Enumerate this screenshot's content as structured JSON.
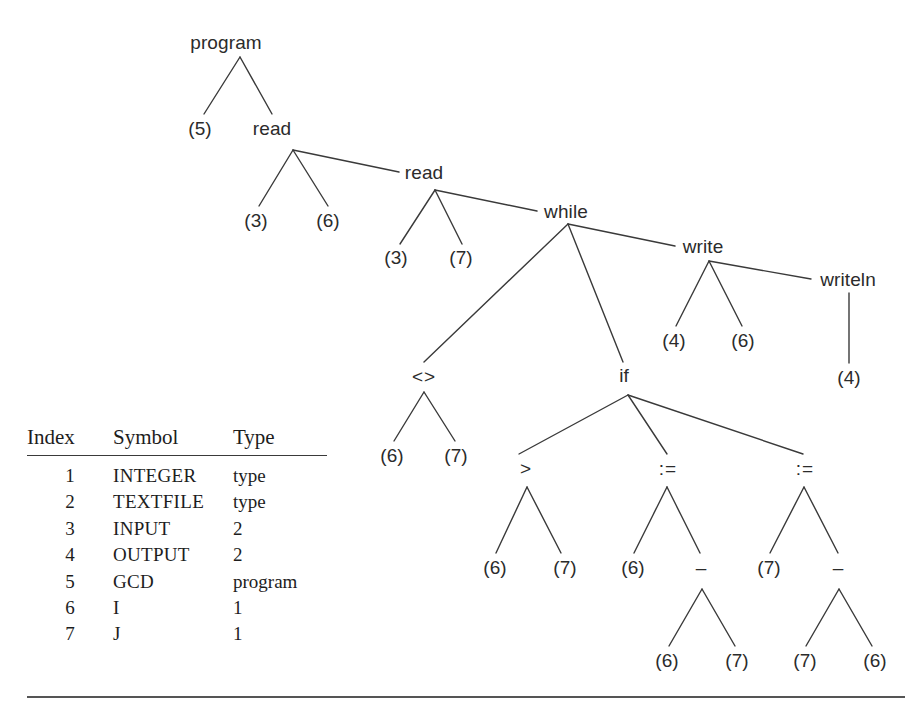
{
  "figure": {
    "type": "syntax-tree-with-symbol-table",
    "line_color": "#3a3a3a",
    "text_color": "#2b2b2b"
  },
  "tree": {
    "nodes": [
      {
        "id": "program",
        "label": "program",
        "x": 226,
        "y": 42,
        "apex_x": 240,
        "apex_y": 57
      },
      {
        "id": "n5",
        "label": "(5)",
        "x": 200,
        "y": 128
      },
      {
        "id": "read1",
        "label": "read",
        "x": 272,
        "y": 128,
        "apex_x": 293,
        "apex_y": 150
      },
      {
        "id": "n3a",
        "label": "(3)",
        "x": 256,
        "y": 220
      },
      {
        "id": "n6a",
        "label": "(6)",
        "x": 328,
        "y": 220
      },
      {
        "id": "read2",
        "label": "read",
        "x": 424,
        "y": 172,
        "apex_x": 435,
        "apex_y": 190
      },
      {
        "id": "n3b",
        "label": "(3)",
        "x": 396,
        "y": 257
      },
      {
        "id": "n7a",
        "label": "(7)",
        "x": 461,
        "y": 257
      },
      {
        "id": "while",
        "label": "while",
        "x": 566,
        "y": 211,
        "apex_x": 568,
        "apex_y": 224
      },
      {
        "id": "write",
        "label": "write",
        "x": 703,
        "y": 246,
        "apex_x": 709,
        "apex_y": 261
      },
      {
        "id": "n4a",
        "label": "(4)",
        "x": 674,
        "y": 340
      },
      {
        "id": "n6b",
        "label": "(6)",
        "x": 743,
        "y": 340
      },
      {
        "id": "writeln",
        "label": "writeln",
        "x": 848,
        "y": 279,
        "apex_x": 849,
        "apex_y": 293
      },
      {
        "id": "n4b",
        "label": "(4)",
        "x": 849,
        "y": 377
      },
      {
        "id": "ne",
        "label": "<>",
        "x": 424,
        "y": 376,
        "apex_x": 424,
        "apex_y": 392
      },
      {
        "id": "n6c",
        "label": "(6)",
        "x": 392,
        "y": 455
      },
      {
        "id": "n7b",
        "label": "(7)",
        "x": 456,
        "y": 455
      },
      {
        "id": "if",
        "label": "if",
        "x": 624,
        "y": 375,
        "apex_x": 628,
        "apex_y": 395
      },
      {
        "id": "gt",
        "label": ">",
        "x": 526,
        "y": 468,
        "apex_x": 527,
        "apex_y": 487
      },
      {
        "id": "n6d",
        "label": "(6)",
        "x": 495,
        "y": 567
      },
      {
        "id": "n7c",
        "label": "(7)",
        "x": 565,
        "y": 567
      },
      {
        "id": "assign1",
        "label": ":=",
        "x": 668,
        "y": 468,
        "apex_x": 667,
        "apex_y": 487
      },
      {
        "id": "n6e",
        "label": "(6)",
        "x": 633,
        "y": 567
      },
      {
        "id": "minus1",
        "label": "–",
        "x": 701,
        "y": 567,
        "apex_x": 702,
        "apex_y": 589
      },
      {
        "id": "n6f",
        "label": "(6)",
        "x": 667,
        "y": 660
      },
      {
        "id": "n7d",
        "label": "(7)",
        "x": 737,
        "y": 660
      },
      {
        "id": "assign2",
        "label": ":=",
        "x": 805,
        "y": 468,
        "apex_x": 804,
        "apex_y": 487
      },
      {
        "id": "n7e",
        "label": "(7)",
        "x": 769,
        "y": 567
      },
      {
        "id": "minus2",
        "label": "–",
        "x": 838,
        "y": 567,
        "apex_x": 839,
        "apex_y": 589
      },
      {
        "id": "n7f",
        "label": "(7)",
        "x": 805,
        "y": 660
      },
      {
        "id": "n6g",
        "label": "(6)",
        "x": 875,
        "y": 660
      }
    ],
    "edges": [
      {
        "from": "program",
        "to": "n5",
        "x1": 240,
        "y1": 57,
        "x2": 204,
        "y2": 114
      },
      {
        "from": "program",
        "to": "read1",
        "x1": 240,
        "y1": 57,
        "x2": 272,
        "y2": 114
      },
      {
        "from": "read1",
        "to": "n3a",
        "x1": 293,
        "y1": 150,
        "x2": 259,
        "y2": 206
      },
      {
        "from": "read1",
        "to": "n6a",
        "x1": 293,
        "y1": 150,
        "x2": 328,
        "y2": 206
      },
      {
        "from": "read1",
        "to": "read2",
        "x1": 293,
        "y1": 150,
        "x2": 399,
        "y2": 172
      },
      {
        "from": "read2",
        "to": "n3b",
        "x1": 435,
        "y1": 190,
        "x2": 400,
        "y2": 244
      },
      {
        "from": "read2",
        "to": "n7a",
        "x1": 435,
        "y1": 190,
        "x2": 462,
        "y2": 244
      },
      {
        "from": "read2",
        "to": "while",
        "x1": 435,
        "y1": 190,
        "x2": 537,
        "y2": 211
      },
      {
        "from": "while",
        "to": "ne",
        "x1": 568,
        "y1": 224,
        "x2": 424,
        "y2": 362
      },
      {
        "from": "while",
        "to": "if",
        "x1": 568,
        "y1": 224,
        "x2": 623,
        "y2": 362
      },
      {
        "from": "while",
        "to": "write",
        "x1": 568,
        "y1": 224,
        "x2": 675,
        "y2": 246
      },
      {
        "from": "write",
        "to": "n4a",
        "x1": 709,
        "y1": 261,
        "x2": 676,
        "y2": 326
      },
      {
        "from": "write",
        "to": "n6b",
        "x1": 709,
        "y1": 261,
        "x2": 742,
        "y2": 326
      },
      {
        "from": "write",
        "to": "writeln",
        "x1": 709,
        "y1": 261,
        "x2": 811,
        "y2": 279
      },
      {
        "from": "writeln",
        "to": "n4b",
        "x1": 849,
        "y1": 293,
        "x2": 849,
        "y2": 363
      },
      {
        "from": "ne",
        "to": "n6c",
        "x1": 424,
        "y1": 392,
        "x2": 394,
        "y2": 441
      },
      {
        "from": "ne",
        "to": "n7b",
        "x1": 424,
        "y1": 392,
        "x2": 455,
        "y2": 441
      },
      {
        "from": "if",
        "to": "gt",
        "x1": 628,
        "y1": 395,
        "x2": 519,
        "y2": 454
      },
      {
        "from": "if",
        "to": "assign1",
        "x1": 628,
        "y1": 395,
        "x2": 667,
        "y2": 454
      },
      {
        "from": "if",
        "to": "assign2",
        "x1": 628,
        "y1": 395,
        "x2": 803,
        "y2": 454
      },
      {
        "from": "gt",
        "to": "n6d",
        "x1": 527,
        "y1": 487,
        "x2": 496,
        "y2": 553
      },
      {
        "from": "gt",
        "to": "n7c",
        "x1": 527,
        "y1": 487,
        "x2": 561,
        "y2": 553
      },
      {
        "from": "assign1",
        "to": "n6e",
        "x1": 667,
        "y1": 487,
        "x2": 634,
        "y2": 553
      },
      {
        "from": "assign1",
        "to": "minus1",
        "x1": 667,
        "y1": 487,
        "x2": 700,
        "y2": 553
      },
      {
        "from": "minus1",
        "to": "n6f",
        "x1": 702,
        "y1": 589,
        "x2": 669,
        "y2": 646
      },
      {
        "from": "minus1",
        "to": "n7d",
        "x1": 702,
        "y1": 589,
        "x2": 735,
        "y2": 646
      },
      {
        "from": "assign2",
        "to": "n7e",
        "x1": 804,
        "y1": 487,
        "x2": 770,
        "y2": 553
      },
      {
        "from": "assign2",
        "to": "minus2",
        "x1": 804,
        "y1": 487,
        "x2": 838,
        "y2": 553
      },
      {
        "from": "minus2",
        "to": "n7f",
        "x1": 839,
        "y1": 589,
        "x2": 806,
        "y2": 646
      },
      {
        "from": "minus2",
        "to": "n6g",
        "x1": 839,
        "y1": 589,
        "x2": 872,
        "y2": 646
      }
    ]
  },
  "symbol_table": {
    "columns": [
      "Index",
      "Symbol",
      "Type"
    ],
    "rows": [
      {
        "index": "1",
        "symbol": "INTEGER",
        "type": "type"
      },
      {
        "index": "2",
        "symbol": "TEXTFILE",
        "type": "type"
      },
      {
        "index": "3",
        "symbol": "INPUT",
        "type": "2"
      },
      {
        "index": "4",
        "symbol": "OUTPUT",
        "type": "2"
      },
      {
        "index": "5",
        "symbol": "GCD",
        "type": "program"
      },
      {
        "index": "6",
        "symbol": "I",
        "type": "1"
      },
      {
        "index": "7",
        "symbol": "J",
        "type": "1"
      }
    ]
  }
}
